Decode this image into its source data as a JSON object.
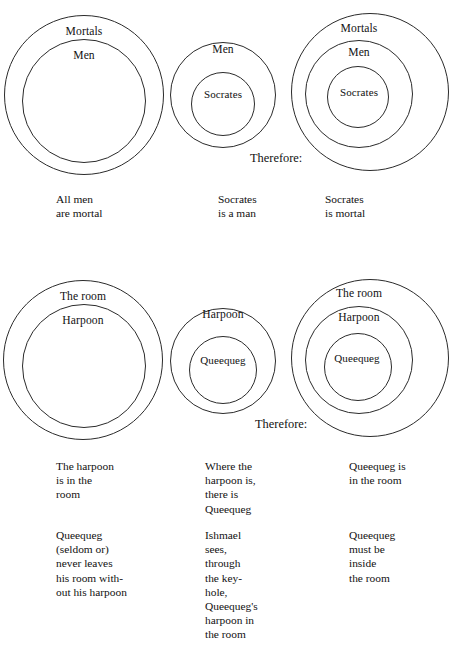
{
  "figure": {
    "type": "euler-diagram-syllogism",
    "background_color": "#ffffff",
    "stroke_color": "#2b2b2b",
    "text_color": "#111111"
  },
  "groups": [
    {
      "id": "socrates-syllogism",
      "connector": "Therefore:",
      "panels": [
        {
          "id": "panel-1-1",
          "role": "major-premise",
          "circle_labels": [
            "Mortals",
            "Men"
          ],
          "caption_lines": [
            "All men",
            "are mortal"
          ],
          "caption2_lines": []
        },
        {
          "id": "panel-1-2",
          "role": "minor-premise",
          "circle_labels": [
            "Men",
            "Socrates"
          ],
          "caption_lines": [
            "Socrates",
            "is a man"
          ],
          "caption2_lines": []
        },
        {
          "id": "panel-1-3",
          "role": "conclusion",
          "circle_labels": [
            "Mortals",
            "Men",
            "Socrates"
          ],
          "caption_lines": [
            "Socrates",
            "is mortal"
          ],
          "caption2_lines": []
        }
      ]
    },
    {
      "id": "queequeg-syllogism",
      "connector": "Therefore:",
      "panels": [
        {
          "id": "panel-2-1",
          "role": "major-premise",
          "circle_labels": [
            "The room",
            "Harpoon"
          ],
          "caption_lines": [
            "The harpoon",
            "is in the",
            "room"
          ],
          "caption2_lines": [
            "Queequeg",
            "(seldom or)",
            "never leaves",
            "his room with-",
            "out his harpoon"
          ]
        },
        {
          "id": "panel-2-2",
          "role": "minor-premise",
          "circle_labels": [
            "Harpoon",
            "Queequeg"
          ],
          "caption_lines": [
            "Where the",
            "harpoon is,",
            "there is",
            "Queequeg"
          ],
          "caption2_lines": [
            "Ishmael",
            "sees,",
            "through",
            "the key-",
            "hole,",
            "Queequeg's",
            "harpoon in",
            "the room"
          ]
        },
        {
          "id": "panel-2-3",
          "role": "conclusion",
          "circle_labels": [
            "The room",
            "Harpoon",
            "Queequeg"
          ],
          "caption_lines": [
            "Queequeg is",
            "in the room"
          ],
          "caption2_lines": [
            "Queequeg",
            "must be",
            "inside",
            "the room"
          ]
        }
      ]
    }
  ]
}
